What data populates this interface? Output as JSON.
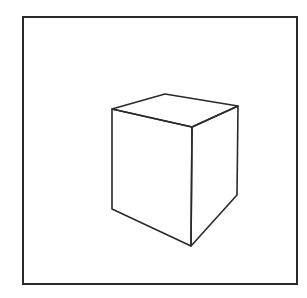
{
  "diagram": {
    "colors": {
      "background": "#ffffff",
      "stroke": "#2a2a2a"
    },
    "frame": {
      "x": 23,
      "y": 17,
      "width": 274,
      "height": 267,
      "stroke_width": 2
    },
    "cube": {
      "stroke_width": 1.6,
      "vertices": {
        "top_left": [
          112,
          109
        ],
        "top_back": [
          165,
          94
        ],
        "top_right": [
          238,
          106
        ],
        "top_front": [
          192,
          127
        ],
        "bottom_left": [
          112,
          209
        ],
        "bottom_front": [
          191,
          246
        ],
        "bottom_right": [
          237,
          195
        ]
      },
      "faces": {
        "top": [
          "top_left",
          "top_back",
          "top_right",
          "top_front"
        ],
        "left": [
          "top_left",
          "top_front",
          "bottom_front",
          "bottom_left"
        ],
        "right": [
          "top_front",
          "top_right",
          "bottom_right",
          "bottom_front"
        ]
      }
    }
  }
}
